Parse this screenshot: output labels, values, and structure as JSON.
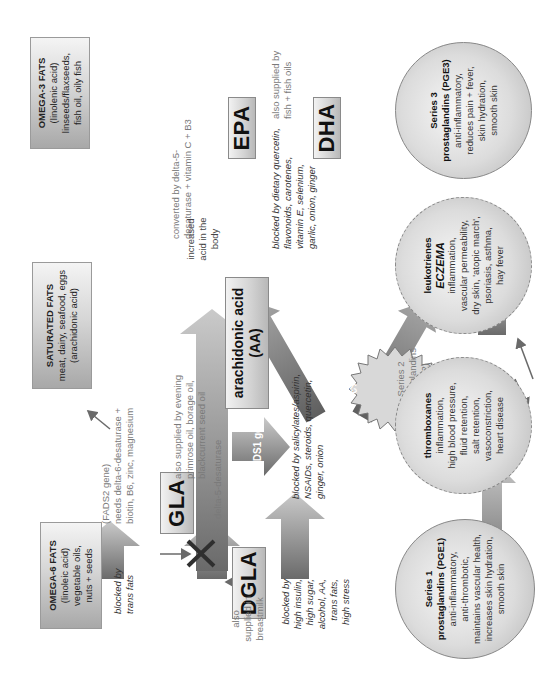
{
  "title": {
    "text": "Omega-6, omega-3 and arachidonic acid pathways",
    "visible": "clipped (only descenders visible at top edge)"
  },
  "sources": {
    "omega6": {
      "heading": "OMEGA-6 FATS",
      "lines": [
        "(linoleic acid)",
        "vegetable oils,",
        "nuts + seeds"
      ]
    },
    "saturated": {
      "heading": "SATURATED FATS",
      "lines": [
        "meat, dairy, seafood, eggs",
        "(arachidonic acid)"
      ]
    },
    "omega3": {
      "heading": "OMEGA-3 FATS",
      "lines": [
        "(linolenic acid)",
        "linseeds/flaxseeds,",
        "fish oil, oily fish"
      ]
    }
  },
  "nodes": {
    "gla": "GLA",
    "dgla": "DGLA",
    "aa_line1": "arachidonic acid",
    "aa_line2": "(AA)",
    "epa": "EPA",
    "dha": "DHA"
  },
  "burst": {
    "lines": [
      "increased",
      "acid in the",
      "body"
    ]
  },
  "notes": {
    "blocked_trans": [
      "blocked by",
      "trans fats"
    ],
    "fads2": [
      "(FADS2 gene)",
      "needs delta-6-desaturase +",
      "biotin, B6, zinc, magnesium"
    ],
    "gla_supply": [
      "also supplied by evening",
      "primrose oil, borage oil,",
      "blackcurrent seed oil"
    ],
    "breastmilk": [
      "also",
      "supplied in",
      "breastmilk"
    ],
    "dgla_blocked": [
      "blocked by",
      "high insulin,",
      "high sugar,",
      "alcohol, AA,",
      "trans fats,",
      "high stress"
    ],
    "delta5": "delta-5-desaturase",
    "fads1_gene": "FADS1 gene",
    "cox_blocked": [
      "blocked by salicylates/aspirin,",
      "NSAIDs, steroids, quercetin,",
      "ginger, onion"
    ],
    "lox_blocked": [
      "blocked by dietary quercetin,",
      "flavonoids, carotenes,",
      "vitamin E, selenium,",
      "garlic, onion, ginger"
    ],
    "omega3_convert": [
      "converted by delta-5-",
      "desaturase + vitamin C + B3"
    ],
    "fish_supply": [
      "also supplied by",
      "fish + fish oils"
    ],
    "series2": [
      "Series 2",
      "prostaglandins",
      "(PGE2)"
    ]
  },
  "enzymes": {
    "cyclooxygenase": "cyclooxygenase",
    "lipoxygenase": "lipoxygenase"
  },
  "outcomes": {
    "series1": {
      "lines_bold": [
        "Series 1",
        "prostaglandins (PGE1)"
      ],
      "lines": [
        "anti-inflammatory,",
        "anti-thrombotic,",
        "maintains vascular health,",
        "increases skin hydration,",
        "smooth skin"
      ]
    },
    "thromboxanes": {
      "heading": "thromboxanes",
      "lines": [
        "inflammation,",
        "high blood pressure,",
        "fluid retention,",
        "salt retention,",
        "vasoconstriction,",
        "heart disease"
      ]
    },
    "leukotrienes": {
      "heading": "leukotrienes",
      "emphasis": "ECZEMA",
      "lines": [
        "inflammation,",
        "vascular permeability,",
        "dry skin, 'atopic march',",
        "psoriasis, asthma,",
        "hay fever"
      ]
    },
    "series3": {
      "lines_bold": [
        "Series 3",
        "prostaglandins (PGE3)"
      ],
      "lines": [
        "anti-inflammatory,",
        "reduces pain + fever,",
        "skin hydration,",
        "smooth skin"
      ]
    }
  },
  "colors": {
    "arrow_dark": "#6e6e6e",
    "arrow_light": "#c4c4c4",
    "box_border": "#8a8a8a",
    "note_grey": "#7a7a7a",
    "x_mark": "#333333"
  }
}
